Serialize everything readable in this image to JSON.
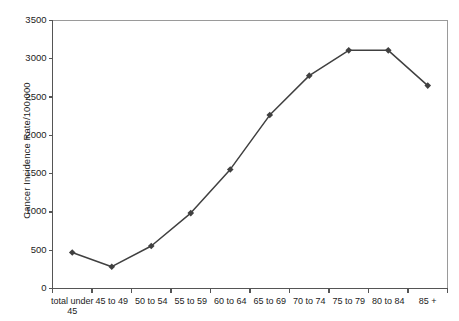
{
  "chart_data": {
    "type": "line",
    "title": "",
    "xlabel": "",
    "ylabel": "Cancer Incidence Rate/100,000",
    "categories": [
      "total under 45",
      "45 to 49",
      "50 to 54",
      "55 to 59",
      "60 to 64",
      "65 to 69",
      "70 to 74",
      "75 to 79",
      "80 to 84",
      "85 +"
    ],
    "values": [
      470,
      285,
      555,
      985,
      1555,
      2265,
      2780,
      3110,
      3110,
      2650
    ],
    "ylim": [
      0,
      3500
    ],
    "ytick_labels": [
      "0",
      "500",
      "1000",
      "1500",
      "2000",
      "2500",
      "3000",
      "3500"
    ],
    "ytick_values": [
      0,
      500,
      1000,
      1500,
      2000,
      2500,
      3000,
      3500
    ],
    "grid": false,
    "legend": "none",
    "series_color": "#404040",
    "marker": "diamond",
    "axis_color": "#555555"
  }
}
